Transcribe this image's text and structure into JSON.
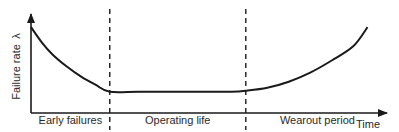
{
  "chart_data": {
    "type": "line",
    "title": "",
    "xlabel": "Time",
    "ylabel": "Failure rate",
    "ylabel_symbol": "λ",
    "xlim": [
      0,
      100
    ],
    "ylim": [
      0,
      100
    ],
    "grid": false,
    "legend": "none",
    "regions": [
      {
        "label": "Early failures",
        "x_start": 0,
        "x_end": 22
      },
      {
        "label": "Operating life",
        "x_start": 22,
        "x_end": 60
      },
      {
        "label": "Wearout period",
        "x_start": 60,
        "x_end": 100
      }
    ],
    "boundaries": [
      22,
      60
    ],
    "series": [
      {
        "name": "Failure rate curve (bathtub)",
        "x": [
          0,
          3,
          6,
          10,
          14,
          18,
          22,
          30,
          40,
          50,
          56,
          60,
          66,
          72,
          78,
          84,
          90,
          94
        ],
        "y": [
          85,
          70,
          58,
          46,
          36,
          28,
          21,
          21,
          21,
          21,
          21,
          22,
          25,
          31,
          40,
          52,
          66,
          85
        ]
      }
    ]
  }
}
